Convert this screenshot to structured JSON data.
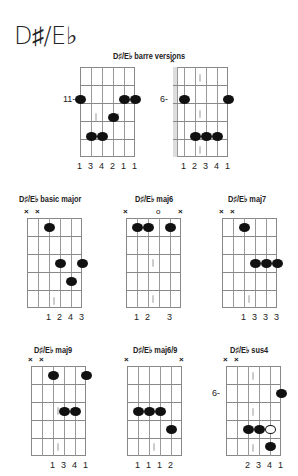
{
  "page": {
    "title": "D♯/E♭"
  },
  "sections": {
    "barre": "D♯/E♭ barre versions",
    "basic_major": "D♯/E♭ basic major",
    "maj6": "D♯/E♭ maj6",
    "maj7": "D♯/E♭ maj7",
    "maj9": "D♯/E♭ maj9",
    "maj69": "D♯/E♭ maj6/9",
    "sus4": "D♯/E♭ sus4"
  },
  "chords": {
    "barre1": {
      "position_label": "11-",
      "fingering": [
        "1",
        "3",
        "4",
        "2",
        "1",
        "1"
      ]
    },
    "barre2": {
      "position_label": "6-",
      "mute_marks": [
        "×"
      ],
      "fingering": [
        "1",
        "2",
        "3",
        "4",
        "1"
      ]
    },
    "basic_major": {
      "mute_marks": [
        "×",
        "×"
      ],
      "fingering": [
        "1",
        "2",
        "4",
        "3"
      ]
    },
    "maj6": {
      "mute_marks": [
        "×",
        "×"
      ],
      "open_marks": [
        "o"
      ],
      "fingering": [
        "1",
        "2",
        "3"
      ]
    },
    "maj7": {
      "mute_marks": [
        "×",
        "×"
      ],
      "fingering": [
        "1",
        "3",
        "3",
        "3"
      ]
    },
    "maj9": {
      "mute_marks": [
        "×",
        "×"
      ],
      "fingering": [
        "1",
        "3",
        "4",
        "1"
      ]
    },
    "maj69": {
      "mute_marks": [
        "×",
        "×"
      ],
      "fingering": [
        "1",
        "1",
        "1",
        "2"
      ]
    },
    "sus4": {
      "position_label": "6-",
      "mute_marks": [
        "×",
        "×"
      ],
      "fingering": [
        "2",
        "3",
        "4",
        "1"
      ]
    }
  }
}
